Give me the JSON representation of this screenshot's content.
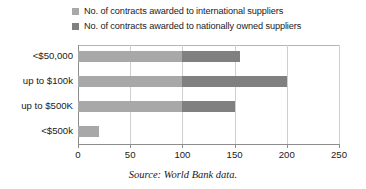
{
  "chart_data": {
    "type": "bar",
    "orientation": "horizontal",
    "stacked": true,
    "title": "",
    "xlabel": "",
    "ylabel": "",
    "xlim": [
      0,
      250
    ],
    "xticks": [
      0,
      50,
      100,
      150,
      200,
      250
    ],
    "xtick_labels": [
      "0",
      "50",
      "100",
      "150",
      "200",
      "250"
    ],
    "grid": true,
    "grid_axis": "x",
    "legend_position": "top-left",
    "categories": [
      "<$50,000",
      "up to $100k",
      "up to $500K",
      "<$500k"
    ],
    "series": [
      {
        "name": "No. of contracts awarded to international suppliers",
        "color": "#a8a8a8",
        "values": [
          100,
          100,
          100,
          20
        ]
      },
      {
        "name": "No. of contracts awarded to nationally owned suppliers",
        "color": "#808080",
        "values": [
          55,
          100,
          50,
          0
        ]
      }
    ],
    "totals": [
      155,
      200,
      150,
      20
    ],
    "caption": "Source: World Bank data."
  },
  "legend": {
    "items": [
      {
        "label": "No. of contracts awarded to international suppliers",
        "color": "#a8a8a8"
      },
      {
        "label": "No. of contracts awarded to nationally owned suppliers",
        "color": "#808080"
      }
    ]
  },
  "axis": {
    "tick_labels": [
      "0",
      "50",
      "100",
      "150",
      "200",
      "250"
    ]
  },
  "categories": {
    "labels": [
      "<$50,000",
      "up to $100k",
      "up to $500K",
      "<$500k"
    ]
  },
  "caption": {
    "text": "Source: World Bank data."
  }
}
